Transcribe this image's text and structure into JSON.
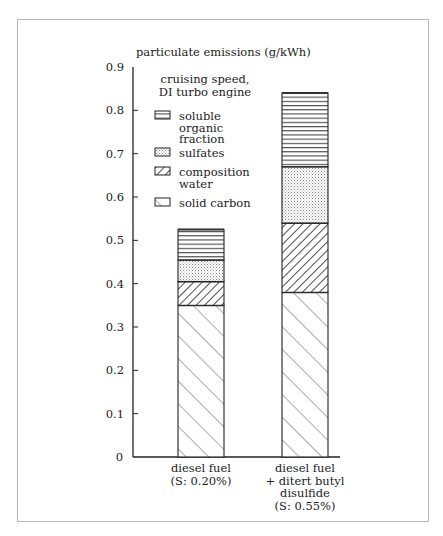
{
  "chart_data": {
    "type": "bar",
    "stacked": true,
    "title": "particulate emissions (g/kWh)",
    "ylabel": "particulate emissions (g/kWh)",
    "xlabel": "",
    "ylim": [
      0,
      0.9
    ],
    "yticks": [
      "0",
      "0.1",
      "0.2",
      "0.3",
      "0.4",
      "0.5",
      "0.6",
      "0.7",
      "0.8",
      "0.9"
    ],
    "grid": false,
    "legend_position": "upper-left inside axes",
    "annotation": [
      "cruising speed,",
      "DI turbo engine"
    ],
    "categories": [
      [
        "diesel fuel",
        "(S: 0.20%)"
      ],
      [
        "diesel fuel",
        "+ ditert butyl",
        "disulfide",
        "(S: 0.55%)"
      ]
    ],
    "series": [
      {
        "name": "solid carbon",
        "pattern": "diagonal-forward-wide",
        "values": [
          0.35,
          0.38
        ]
      },
      {
        "name": "composition water",
        "pattern": "diagonal-back-dense",
        "values": [
          0.055,
          0.16
        ]
      },
      {
        "name": "sulfates",
        "pattern": "dotted",
        "values": [
          0.05,
          0.13
        ]
      },
      {
        "name": "soluble organic fraction",
        "pattern": "horizontal-lines",
        "values": [
          0.07,
          0.17
        ]
      }
    ],
    "totals": [
      0.525,
      0.84
    ]
  },
  "legend": {
    "items": [
      {
        "lines": [
          "soluble",
          "organic",
          "fraction"
        ],
        "pattern": "hlines"
      },
      {
        "lines": [
          "sulfates"
        ],
        "pattern": "dots"
      },
      {
        "lines": [
          "composition",
          "water"
        ],
        "pattern": "backdiag"
      },
      {
        "lines": [
          "solid carbon"
        ],
        "pattern": "fwddiag"
      }
    ]
  },
  "colors": {
    "ink": "#222222",
    "frame": "#b8b8b8",
    "dots": "#9a9a9a"
  }
}
